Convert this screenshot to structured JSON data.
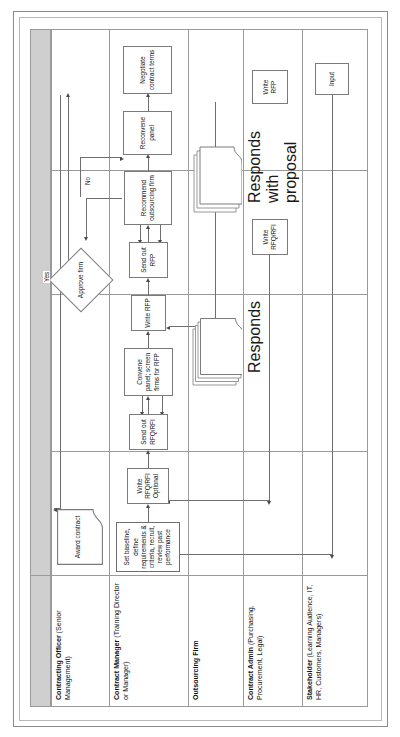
{
  "diagram": {
    "orientation": "rotated-90-ccw",
    "colors": {
      "header_band": "#cfcfcf",
      "grid_line": "#9a9a9a",
      "node_border": "#7a7a7a",
      "connector": "#6e6e6e",
      "page_background": "#ffffff"
    },
    "lanes": [
      {
        "id": "contracting-officer",
        "title": "Contracting Officer",
        "subtitle": "(Senior Management)"
      },
      {
        "id": "contract-manager",
        "title": "Contract Manager",
        "subtitle": "(Training Director or Manager)"
      },
      {
        "id": "outsourcing-firm",
        "title": "Outsourcing Firm",
        "subtitle": ""
      },
      {
        "id": "contract-admin",
        "title": "Contract Admin",
        "subtitle": "(Purchasing, Procurement, Legal)"
      },
      {
        "id": "stakeholder",
        "title": "Stakeholder",
        "subtitle": "(Learning Audience, IT, HR, Customers, Managers)"
      }
    ],
    "nodes": {
      "award_contract": "Award contract",
      "negotiate_contract_terms": "Negotiate contract terms",
      "approve_firm": "Approve firm",
      "reconvene_panel": "Reconvene panel",
      "recommend_outsourcing_firm": "Recommend outsourcing firm",
      "send_out_rfp": "Send out RFP",
      "write_rfp": "Write RFP",
      "convene_panel_screen": "Convene panel; screen firms for RFP",
      "send_out_rfq_rfi": "Send out RFQ/RFI",
      "write_rfq_rfi_optional": "Write RFQ/RFI Optional",
      "set_baseline": "Set baseline, define requirements & criteria, recruit, review past performance",
      "responds_with_proposal": "Responds with proposal",
      "responds": "Responds",
      "admin_write_rfp": "Write RFP",
      "admin_write_rfq_rfi": "Write RFQ/RFI",
      "input": "Input"
    },
    "edge_labels": {
      "yes": "Yes",
      "no": "No"
    }
  }
}
